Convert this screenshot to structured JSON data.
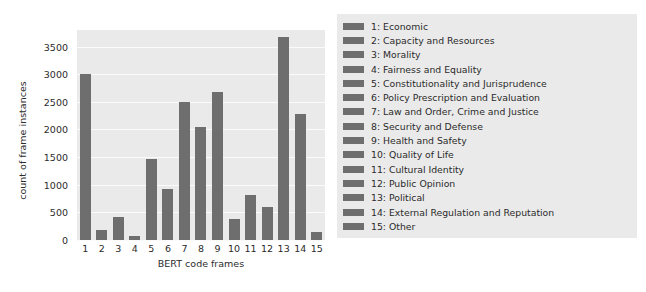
{
  "chart_data": {
    "type": "bar",
    "title": "",
    "xlabel": "BERT code frames",
    "ylabel": "count of frame instances",
    "categories": [
      "1",
      "2",
      "3",
      "4",
      "5",
      "6",
      "7",
      "8",
      "9",
      "10",
      "11",
      "12",
      "13",
      "14",
      "15"
    ],
    "values": [
      3000,
      190,
      410,
      70,
      1470,
      920,
      2500,
      2040,
      2680,
      380,
      810,
      600,
      3680,
      2280,
      140
    ],
    "ylim": [
      0,
      3800
    ],
    "yticks": [
      0,
      500,
      1000,
      1500,
      2000,
      2500,
      3000,
      3500
    ],
    "ytick_labels": [
      "0",
      "500",
      "1000",
      "1500",
      "2000",
      "2500",
      "3000",
      "3500"
    ],
    "xtick_labels": [
      "1",
      "2",
      "3",
      "4",
      "5",
      "6",
      "7",
      "8",
      "9",
      "10",
      "11",
      "12",
      "13",
      "14",
      "15"
    ],
    "grid": true,
    "legend_position": "right",
    "bar_color": "#6e6e6e",
    "plot_background": "#eaeaea",
    "legend": [
      {
        "key": "1",
        "label": "1: Economic"
      },
      {
        "key": "2",
        "label": "2: Capacity and Resources"
      },
      {
        "key": "3",
        "label": "3: Morality"
      },
      {
        "key": "4",
        "label": "4: Fairness and Equality"
      },
      {
        "key": "5",
        "label": "5: Constitutionality and Jurisprudence"
      },
      {
        "key": "6",
        "label": "6: Policy Prescription and Evaluation"
      },
      {
        "key": "7",
        "label": "7: Law and Order, Crime and Justice"
      },
      {
        "key": "8",
        "label": "8: Security and Defense"
      },
      {
        "key": "9",
        "label": "9: Health and Safety"
      },
      {
        "key": "10",
        "label": "10: Quality of Life"
      },
      {
        "key": "11",
        "label": "11: Cultural Identity"
      },
      {
        "key": "12",
        "label": "12: Public Opinion"
      },
      {
        "key": "13",
        "label": "13: Political"
      },
      {
        "key": "14",
        "label": "14: External Regulation and Reputation"
      },
      {
        "key": "15",
        "label": "15: Other"
      }
    ]
  }
}
